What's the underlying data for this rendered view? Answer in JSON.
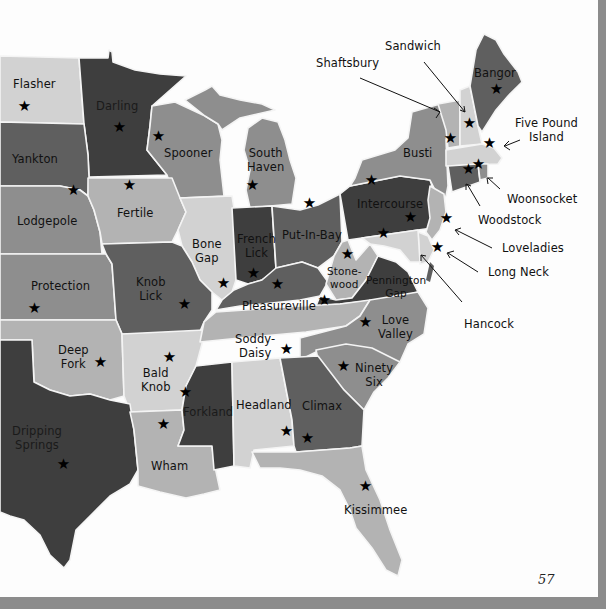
{
  "page": {
    "page_number": "57",
    "colors": {
      "very_dark": "#3e3e3e",
      "dark": "#5f5f5f",
      "medium": "#8e8e8e",
      "light": "#b3b3b3",
      "very_light": "#d2d2d2",
      "paper": "#fdfdfd",
      "border": "#8c8c8c"
    }
  },
  "map": {
    "star_icon": "★",
    "states": [
      {
        "id": "nd",
        "label": "Flasher"
      },
      {
        "id": "mn",
        "label": "Darling"
      },
      {
        "id": "sd",
        "label": "Yankton"
      },
      {
        "id": "wi",
        "label": "Spooner"
      },
      {
        "id": "mi",
        "label": "South Haven",
        "line1": "South",
        "line2": "Haven"
      },
      {
        "id": "ne",
        "label": "Lodgepole"
      },
      {
        "id": "ia",
        "label": "Fertile"
      },
      {
        "id": "il",
        "label": "Bone Gap",
        "line1": "Bone",
        "line2": "Gap"
      },
      {
        "id": "in",
        "label": "French Lick",
        "line1": "French",
        "line2": "Lick"
      },
      {
        "id": "oh",
        "label": "Put-In-Bay"
      },
      {
        "id": "pa",
        "label": "Intercourse"
      },
      {
        "id": "ny",
        "label": "Busti"
      },
      {
        "id": "me",
        "label": "Bangor"
      },
      {
        "id": "ks",
        "label": "Protection"
      },
      {
        "id": "mo",
        "label": "Knob Lick",
        "line1": "Knob",
        "line2": "Lick"
      },
      {
        "id": "ky",
        "label": "Pleasureville"
      },
      {
        "id": "wv",
        "label": "Stonewood",
        "line1": "Stone-",
        "line2": "wood"
      },
      {
        "id": "va",
        "label": "Pennington Gap",
        "line1": "Pennington",
        "line2": "Gap"
      },
      {
        "id": "ok",
        "label": "Deep Fork",
        "line1": "Deep",
        "line2": "Fork"
      },
      {
        "id": "ar",
        "label": "Bald Knob",
        "line1": "Bald",
        "line2": "Knob"
      },
      {
        "id": "tn",
        "label": "Soddy-Daisy",
        "line1": "Soddy-",
        "line2": "Daisy"
      },
      {
        "id": "nc",
        "label": "Love Valley",
        "line1": "Love",
        "line2": "Valley"
      },
      {
        "id": "sc",
        "label": "Ninety Six",
        "line1": "Ninety",
        "line2": "Six"
      },
      {
        "id": "tx",
        "label": "Dripping Springs",
        "line1": "Dripping",
        "line2": "Springs"
      },
      {
        "id": "ms",
        "label": "Forkland"
      },
      {
        "id": "al",
        "label": "Headland"
      },
      {
        "id": "ga",
        "label": "Climax"
      },
      {
        "id": "la",
        "label": "Wham"
      },
      {
        "id": "fl",
        "label": "Kissimmee"
      }
    ],
    "callouts": [
      {
        "id": "vt",
        "label": "Shaftsbury"
      },
      {
        "id": "nh",
        "label": "Sandwich"
      },
      {
        "id": "ma",
        "label": "Five Pound Island",
        "line1": "Five Pound",
        "line2": "Island"
      },
      {
        "id": "ri",
        "label": "Woonsocket"
      },
      {
        "id": "ct",
        "label": "Woodstock"
      },
      {
        "id": "nj",
        "label": "Loveladies"
      },
      {
        "id": "de",
        "label": "Long Neck"
      },
      {
        "id": "md",
        "label": "Hancock"
      }
    ]
  }
}
